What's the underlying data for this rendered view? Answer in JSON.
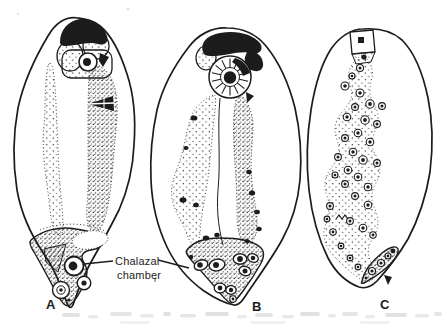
{
  "figure": {
    "panels": [
      {
        "label": "A"
      },
      {
        "label": "B"
      },
      {
        "label": "C"
      }
    ],
    "annotation": {
      "line1": "Chalazal",
      "line2": "chamber",
      "subscript": "r"
    },
    "colors": {
      "ink": "#1c1c1c",
      "paper": "#ffffff",
      "bleed_text": "#bfbfbf"
    }
  }
}
